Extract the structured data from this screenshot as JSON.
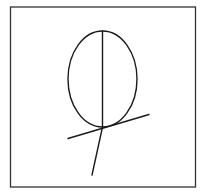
{
  "canvas": {
    "width": 205,
    "height": 195,
    "background": "#ffffff"
  },
  "stroke": {
    "color": "#1a1a1a",
    "frame_color": "#333333",
    "width": 1.4,
    "frame_width": 1.3
  },
  "diagram": {
    "frame": {
      "x": 10.5,
      "y": 7,
      "width": 185,
      "height": 180
    },
    "ellipse": {
      "cx": 102.5,
      "cy": 79,
      "rx": 34.5,
      "ry": 48
    },
    "vertical_axis": {
      "x1": 102.5,
      "y1": 31,
      "x2": 102.5,
      "y2": 127
    },
    "tangent_line": {
      "x1": 68,
      "y1": 138.5,
      "x2": 149,
      "y2": 114.5
    },
    "lower_line": {
      "x1": 102.5,
      "y1": 127,
      "x2": 92,
      "y2": 175
    }
  }
}
